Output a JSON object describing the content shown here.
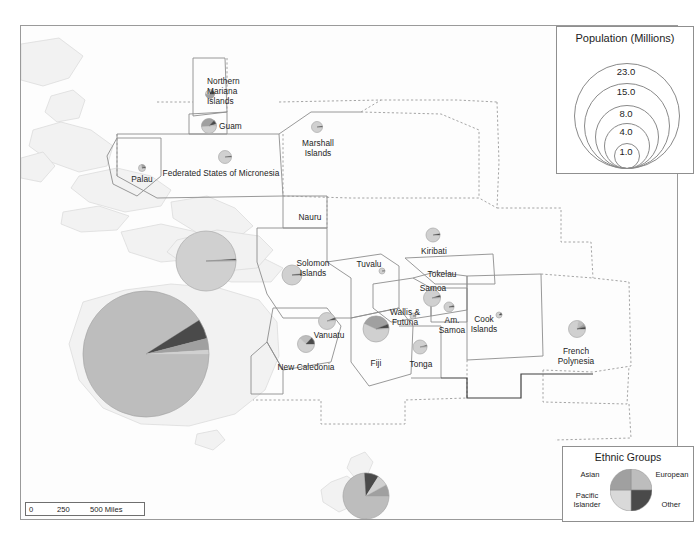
{
  "map": {
    "title": "Pacific Islands Population and Ethnic Composition",
    "background_color": "#fdfdfd",
    "border_color": "#9a9a9a"
  },
  "scale_bar": {
    "name": "scale-bar",
    "ticks": [
      "0",
      "250",
      "500 Miles"
    ],
    "zero": "0",
    "mid": "250",
    "max": "500 Miles"
  },
  "population_legend": {
    "title": "Population (Millions)",
    "values": [
      "23.0",
      "15.0",
      "8.0",
      "4.0",
      "1.0"
    ],
    "v0": "23.0",
    "v1": "15.0",
    "v2": "8.0",
    "v3": "4.0",
    "v4": "1.0"
  },
  "ethnic_legend": {
    "title": "Ethnic Groups",
    "categories": [
      {
        "label": "European",
        "color": "#bdbdbd",
        "quadrant": "top-right"
      },
      {
        "label": "Other",
        "color": "#4a4a4a",
        "quadrant": "bottom-right"
      },
      {
        "label": "Pacific\nIslander",
        "color": "#d9d9d9",
        "quadrant": "bottom-left"
      },
      {
        "label": "Asian",
        "color": "#a0a0a0",
        "quadrant": "top-left"
      }
    ],
    "european": "European",
    "other": "Other",
    "pacific_islander": "Pacific\nIslander",
    "asian": "Asian"
  },
  "colors": {
    "european": "#bdbdbd",
    "asian": "#a0a0a0",
    "pacific_islander": "#d0d0d0",
    "other": "#4a4a4a",
    "land": "#f2f2f2",
    "land_stroke": "#d8d8d8",
    "boundary": "#8d8d8d"
  },
  "places": [
    {
      "name": "Northern Mariana Islands",
      "label": "Northern\nMariana\nIslands"
    },
    {
      "name": "Guam",
      "label": "Guam"
    },
    {
      "name": "Palau",
      "label": "Palau"
    },
    {
      "name": "Federated States of Micronesia",
      "label": "Federated States of Micronesia"
    },
    {
      "name": "Marshall Islands",
      "label": "Marshall\nIslands"
    },
    {
      "name": "Nauru",
      "label": "Nauru"
    },
    {
      "name": "Kiribati",
      "label": "Kiribati"
    },
    {
      "name": "Solomon Islands",
      "label": "Solomon\nIslands"
    },
    {
      "name": "Tuvalu",
      "label": "Tuvalu"
    },
    {
      "name": "Tokelau",
      "label": "Tokelau"
    },
    {
      "name": "Samoa",
      "label": "Samoa"
    },
    {
      "name": "Wallis & Futuna",
      "label": "Wallis &\nFutuna"
    },
    {
      "name": "American Samoa",
      "label": "Am.\nSamoa"
    },
    {
      "name": "Vanuatu",
      "label": "Vanuatu"
    },
    {
      "name": "New Caledonia",
      "label": "New Caledonia"
    },
    {
      "name": "Fiji",
      "label": "Fiji"
    },
    {
      "name": "Tonga",
      "label": "Tonga"
    },
    {
      "name": "Cook Islands",
      "label": "Cook\nIslands"
    },
    {
      "name": "French Polynesia",
      "label": "French\nPolynesia"
    }
  ],
  "labels": {
    "northern_mariana": "Northern\nMariana\nIslands",
    "guam": "Guam",
    "palau": "Palau",
    "fsm": "Federated States of Micronesia",
    "marshall": "Marshall\nIslands",
    "nauru": "Nauru",
    "kiribati": "Kiribati",
    "solomon": "Solomon\nIslands",
    "tuvalu": "Tuvalu",
    "tokelau": "Tokelau",
    "samoa": "Samoa",
    "wallis": "Wallis &\nFutuna",
    "am_samoa": "Am.\nSamoa",
    "vanuatu": "Vanuatu",
    "new_caledonia": "New Caledonia",
    "fiji": "Fiji",
    "tonga": "Tonga",
    "cook": "Cook\nIslands",
    "french_polynesia": "French\nPolynesia"
  },
  "chart_data": {
    "type": "pie",
    "note": "Each map symbol is a pie chart; circle area is proportional to population in millions.",
    "legend_position": "bottom-right",
    "ethnic_categories": [
      "Pacific Islander",
      "European",
      "Asian",
      "Other"
    ],
    "size_legend_breaks": [
      23.0,
      15.0,
      8.0,
      4.0,
      1.0
    ],
    "size_legend_units": "Millions",
    "pies": [
      {
        "place": "Australia",
        "population": 23.0,
        "radius_px": 63,
        "cx": 125,
        "cy": 328,
        "slices": [
          {
            "group": "European",
            "pct": 91.0
          },
          {
            "group": "Other",
            "pct": 5.0
          },
          {
            "group": "Asian",
            "pct": 3.0
          },
          {
            "group": "Pacific Islander",
            "pct": 1.0
          }
        ]
      },
      {
        "place": "Papua New Guinea",
        "population": 7.3,
        "radius_px": 30,
        "cx": 185,
        "cy": 235,
        "slices": [
          {
            "group": "Pacific Islander",
            "pct": 99.0
          },
          {
            "group": "Other",
            "pct": 0.7
          },
          {
            "group": "Asian",
            "pct": 0.2
          },
          {
            "group": "European",
            "pct": 0.1
          }
        ]
      },
      {
        "place": "New Zealand",
        "population": 4.4,
        "radius_px": 23,
        "cx": 345,
        "cy": 470,
        "slices": [
          {
            "group": "European",
            "pct": 74.0
          },
          {
            "group": "Other",
            "pct": 10.0
          },
          {
            "group": "Pacific Islander",
            "pct": 8.0
          },
          {
            "group": "Asian",
            "pct": 8.0
          }
        ]
      },
      {
        "place": "Fiji",
        "population": 0.88,
        "radius_px": 13,
        "cx": 355,
        "cy": 303,
        "slices": [
          {
            "group": "Pacific Islander",
            "pct": 57.0
          },
          {
            "group": "Asian",
            "pct": 37.0
          },
          {
            "group": "Other",
            "pct": 5.0
          },
          {
            "group": "European",
            "pct": 1.0
          }
        ]
      },
      {
        "place": "Solomon Islands",
        "population": 0.6,
        "radius_px": 10,
        "cx": 271,
        "cy": 249,
        "slices": [
          {
            "group": "Pacific Islander",
            "pct": 97.0
          },
          {
            "group": "Asian",
            "pct": 2.0
          },
          {
            "group": "Other",
            "pct": 1.0
          }
        ]
      },
      {
        "place": "Vanuatu",
        "population": 0.27,
        "radius_px": 8.5,
        "cx": 306,
        "cy": 295,
        "slices": [
          {
            "group": "Pacific Islander",
            "pct": 94.0
          },
          {
            "group": "Other",
            "pct": 4.0
          },
          {
            "group": "European",
            "pct": 2.0
          }
        ]
      },
      {
        "place": "New Caledonia",
        "population": 0.27,
        "radius_px": 8.5,
        "cx": 285,
        "cy": 318,
        "slices": [
          {
            "group": "Pacific Islander",
            "pct": 62.0
          },
          {
            "group": "European",
            "pct": 25.0
          },
          {
            "group": "Other",
            "pct": 13.0
          }
        ]
      },
      {
        "place": "Samoa",
        "population": 0.19,
        "radius_px": 8.5,
        "cx": 411,
        "cy": 272,
        "slices": [
          {
            "group": "Pacific Islander",
            "pct": 95.0
          },
          {
            "group": "Other",
            "pct": 4.0
          },
          {
            "group": "European",
            "pct": 1.0
          }
        ]
      },
      {
        "place": "French Polynesia",
        "population": 0.28,
        "radius_px": 8.5,
        "cx": 556,
        "cy": 303,
        "slices": [
          {
            "group": "Pacific Islander",
            "pct": 78.0
          },
          {
            "group": "European",
            "pct": 12.0
          },
          {
            "group": "Asian",
            "pct": 6.0
          },
          {
            "group": "Other",
            "pct": 4.0
          }
        ]
      },
      {
        "place": "Guam",
        "population": 0.16,
        "radius_px": 7.5,
        "cx": 188,
        "cy": 100,
        "slices": [
          {
            "group": "Pacific Islander",
            "pct": 49.0
          },
          {
            "group": "Asian",
            "pct": 38.0
          },
          {
            "group": "Other",
            "pct": 9.0
          },
          {
            "group": "European",
            "pct": 4.0
          }
        ]
      },
      {
        "place": "Tonga",
        "population": 0.11,
        "radius_px": 7,
        "cx": 399,
        "cy": 321,
        "slices": [
          {
            "group": "Pacific Islander",
            "pct": 96.0
          },
          {
            "group": "Other",
            "pct": 3.0
          },
          {
            "group": "European",
            "pct": 1.0
          }
        ]
      },
      {
        "place": "Kiribati",
        "population": 0.11,
        "radius_px": 7,
        "cx": 412,
        "cy": 209,
        "slices": [
          {
            "group": "Pacific Islander",
            "pct": 97.0
          },
          {
            "group": "Other",
            "pct": 3.0
          }
        ]
      },
      {
        "place": "Micronesia",
        "population": 0.1,
        "radius_px": 6.5,
        "cx": 204,
        "cy": 131,
        "slices": [
          {
            "group": "Pacific Islander",
            "pct": 98.0
          },
          {
            "group": "Other",
            "pct": 2.0
          }
        ]
      },
      {
        "place": "Marshall Islands",
        "population": 0.07,
        "radius_px": 5.5,
        "cx": 296,
        "cy": 101,
        "slices": [
          {
            "group": "Pacific Islander",
            "pct": 98.0
          },
          {
            "group": "Other",
            "pct": 2.0
          }
        ]
      },
      {
        "place": "Northern Mariana Islands",
        "population": 0.05,
        "radius_px": 4.5,
        "cx": 189,
        "cy": 68,
        "slices": [
          {
            "group": "Asian",
            "pct": 50.0
          },
          {
            "group": "Pacific Islander",
            "pct": 35.0
          },
          {
            "group": "Other",
            "pct": 15.0
          }
        ]
      },
      {
        "place": "American Samoa",
        "population": 0.055,
        "radius_px": 5,
        "cx": 428,
        "cy": 281,
        "slices": [
          {
            "group": "Pacific Islander",
            "pct": 93.0
          },
          {
            "group": "Asian",
            "pct": 4.0
          },
          {
            "group": "Other",
            "pct": 3.0
          }
        ]
      },
      {
        "place": "Palau",
        "population": 0.021,
        "radius_px": 3.5,
        "cx": 121,
        "cy": 142,
        "slices": [
          {
            "group": "Pacific Islander",
            "pct": 73.0
          },
          {
            "group": "Asian",
            "pct": 22.0
          },
          {
            "group": "Other",
            "pct": 5.0
          }
        ]
      },
      {
        "place": "Tuvalu",
        "population": 0.011,
        "radius_px": 3,
        "cx": 361,
        "cy": 245,
        "slices": [
          {
            "group": "Pacific Islander",
            "pct": 99.0
          },
          {
            "group": "Other",
            "pct": 1.0
          }
        ]
      },
      {
        "place": "Cook Islands",
        "population": 0.015,
        "radius_px": 3,
        "cx": 478,
        "cy": 289,
        "slices": [
          {
            "group": "Pacific Islander",
            "pct": 88.0
          },
          {
            "group": "Other",
            "pct": 12.0
          }
        ]
      },
      {
        "place": "Wallis & Futuna",
        "population": 0.013,
        "radius_px": 3,
        "cx": 392,
        "cy": 290,
        "slices": [
          {
            "group": "Pacific Islander",
            "pct": 99.0
          },
          {
            "group": "Other",
            "pct": 1.0
          }
        ]
      }
    ]
  }
}
